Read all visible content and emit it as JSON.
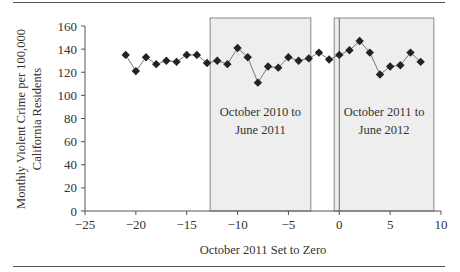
{
  "chart_data": {
    "type": "line",
    "title": "",
    "xlabel": "October 2011 Set to Zero",
    "ylabel_lines": [
      "Monthly Violent Crime per 100,000",
      "California Residents"
    ],
    "ylabel": "Monthly Violent Crime per 100,000 California Residents",
    "xlim": [
      -25,
      10
    ],
    "ylim": [
      0,
      160
    ],
    "x_ticks": [
      -25,
      -20,
      -15,
      -10,
      -5,
      0,
      5,
      10
    ],
    "x_tick_labels": [
      "−25",
      "−20",
      "−15",
      "−10",
      "−5",
      "0",
      "5",
      "10"
    ],
    "y_ticks": [
      0,
      20,
      40,
      60,
      80,
      100,
      120,
      140,
      160
    ],
    "y_tick_labels": [
      "0",
      "20",
      "40",
      "60",
      "80",
      "100",
      "120",
      "140",
      "160"
    ],
    "grid": false,
    "marker": "diamond",
    "series": [
      {
        "name": "Monthly Violent Crime",
        "x": [
          -21,
          -20,
          -19,
          -18,
          -17,
          -16,
          -15,
          -14,
          -13,
          -12,
          -11,
          -10,
          -9,
          -8,
          -7,
          -6,
          -5,
          -4,
          -3,
          -2,
          -1,
          0,
          1,
          2,
          3,
          4,
          5,
          6,
          7,
          8
        ],
        "values": [
          135,
          121,
          133,
          127,
          130,
          129,
          135,
          135,
          128,
          130,
          127,
          141,
          133,
          111,
          125,
          124,
          133,
          130,
          132,
          137,
          131,
          135,
          139,
          147,
          137,
          118,
          125,
          126,
          137,
          129
        ]
      }
    ],
    "annotations": [
      {
        "type": "shaded_region",
        "x_start": -12.7,
        "x_end": -2.8,
        "label_lines": [
          "October 2010 to",
          "June 2011"
        ],
        "label": "October 2010 to June 2011",
        "fill": "#eeeeee"
      },
      {
        "type": "shaded_region",
        "x_start": -0.5,
        "x_end": 9.3,
        "label_lines": [
          "October 2011 to",
          "June 2012"
        ],
        "label": "October 2011 to June 2012",
        "fill": "#eeeeee"
      },
      {
        "type": "vertical_line",
        "x": 0
      }
    ],
    "colors": {
      "line": "#777777",
      "marker": "#222222",
      "axis": "#555555",
      "shade": "#eeeeee",
      "shade_border": "#888888"
    }
  }
}
